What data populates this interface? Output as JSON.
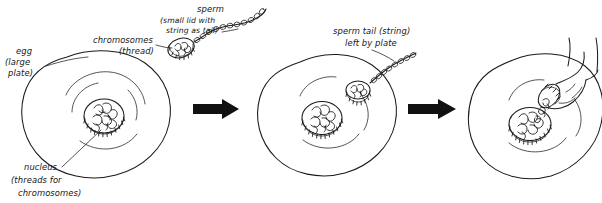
{
  "figure": {
    "domain_note": "hand-drawn pen-and-ink biology sketch, three panels separated by arrows",
    "background_color": "#ffffff",
    "ink_color": "#1b1b1b"
  },
  "labels": {
    "egg": {
      "line1": "egg",
      "line2": "(large",
      "line3": "plate)"
    },
    "chromosomes": {
      "line1": "chromosomes",
      "line2": "(thread)"
    },
    "sperm": {
      "line1": "sperm",
      "line2": "(small lid with",
      "line3": "string as tail)"
    },
    "nucleus": {
      "line1": "nucleus",
      "line2": "(threads for",
      "line3": "chromosomes)"
    },
    "sperm_tail": {
      "line1": "sperm tail (string)",
      "line2": "left by plate"
    }
  },
  "panels": [
    {
      "id": "panel-1",
      "name": "egg-and-approaching-sperm",
      "description": "Large egg cell with nucleus containing tangled chromosome threads; sperm with small hatched lid-shaped head and beaded string tail approaches from upper right."
    },
    {
      "id": "panel-2",
      "name": "sperm-head-inside-egg",
      "description": "Sperm head (small hatched disc) has entered the egg cytoplasm near the upper right; the beaded tail remains outside, left by the plate."
    },
    {
      "id": "panel-3",
      "name": "hand-tipping-chromosomes-into-nucleus",
      "description": "A hand tips the small sperm lid, pouring its chromosome threads into the egg nucleus disc."
    }
  ],
  "arrows": [
    {
      "id": "arrow-1",
      "name": "panel-1-to-panel-2-arrow",
      "glyph": "right-arrow"
    },
    {
      "id": "arrow-2",
      "name": "panel-2-to-panel-3-arrow",
      "glyph": "right-arrow"
    }
  ]
}
